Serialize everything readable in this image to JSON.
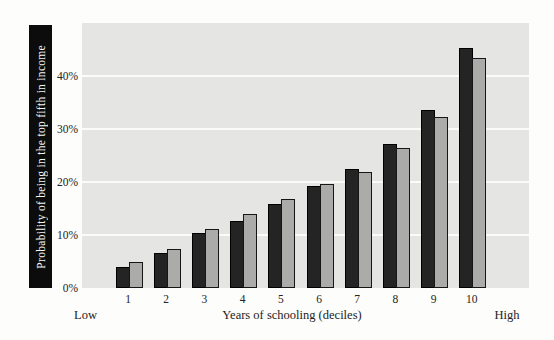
{
  "figure": {
    "y_axis_title": "Probability of being in the top fifth in income",
    "x_axis_title": "Years of schooling (deciles)",
    "x_left_label": "Low",
    "x_right_label": "High"
  },
  "chart_data": {
    "type": "bar",
    "title": "",
    "xlabel": "Years of schooling (deciles)",
    "ylabel": "Probability of being in the top fifth in income",
    "categories": [
      "1",
      "2",
      "3",
      "4",
      "5",
      "6",
      "7",
      "8",
      "9",
      "10"
    ],
    "series": [
      {
        "name": "dark",
        "color": "#242424",
        "values": [
          4.0,
          6.6,
          10.3,
          12.6,
          15.9,
          19.2,
          22.4,
          27.1,
          33.6,
          45.3
        ]
      },
      {
        "name": "light",
        "color": "#ababa9",
        "values": [
          4.9,
          7.4,
          11.2,
          14.0,
          16.8,
          19.6,
          21.8,
          26.4,
          32.3,
          43.4
        ]
      }
    ],
    "y_ticks": [
      {
        "value": 0,
        "label": "0%"
      },
      {
        "value": 10,
        "label": "10%"
      },
      {
        "value": 20,
        "label": "20%"
      },
      {
        "value": 30,
        "label": "30%"
      },
      {
        "value": 40,
        "label": "40%"
      }
    ],
    "gridline_values": [
      10,
      20,
      30,
      40
    ],
    "ylim": [
      0,
      50
    ],
    "grid": true,
    "legend": "none",
    "x_scale_endpoints": {
      "left": "Low",
      "right": "High"
    }
  },
  "colors": {
    "page_background": "#fdfdfb",
    "plot_background": "#e5e5e3",
    "gridline": "#fbfbf9",
    "dark_bar": "#242424",
    "light_bar": "#ababa9",
    "ylabel_bar_background": "#0c0c0c",
    "ylabel_text": "#f6f6f1",
    "axis_text": "#232323"
  }
}
